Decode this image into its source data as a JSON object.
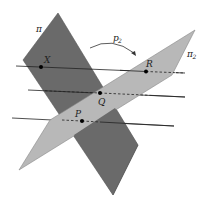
{
  "figure": {
    "type": "two intersecting planes with three lines",
    "colors": {
      "plane_pi": "#6a6a6a",
      "plane_pi2": "#b8b8b8",
      "line": "#222222",
      "point": "#000000"
    },
    "planes": [
      {
        "id": "pi",
        "label": "π",
        "points": "58,13 23,60 113,195 138,145"
      },
      {
        "id": "pi2",
        "label": "π",
        "subscript": "2",
        "points": "195,30 172,75 19,170 50,120"
      }
    ],
    "lines": [
      {
        "id": "line-x",
        "x1": 16,
        "y1": 66,
        "x2": 185,
        "y2": 73
      },
      {
        "id": "line-q",
        "x1": 28,
        "y1": 90,
        "x2": 185,
        "y2": 97
      },
      {
        "id": "line-p",
        "x1": 12,
        "y1": 118,
        "x2": 174,
        "y2": 126
      }
    ],
    "points": [
      {
        "id": "X",
        "label": "X",
        "cx": 41,
        "cy": 67,
        "lx": 45,
        "ly": 63
      },
      {
        "id": "R",
        "label": "R",
        "cx": 146,
        "cy": 72,
        "lx": 146,
        "ly": 68
      },
      {
        "id": "Q",
        "label": "Q",
        "cx": 100,
        "cy": 93,
        "lx": 97,
        "ly": 106
      },
      {
        "id": "P",
        "label": "P",
        "cx": 82,
        "cy": 121,
        "lx": 76,
        "ly": 118
      }
    ],
    "arrow": {
      "label": "p",
      "subscript": "2"
    },
    "labels": {
      "pi": "π",
      "pi2": "π",
      "pi2_sub": "2",
      "p2": "p",
      "p2_sub": "2",
      "X": "X",
      "R": "R",
      "Q": "Q",
      "P": "P"
    }
  }
}
